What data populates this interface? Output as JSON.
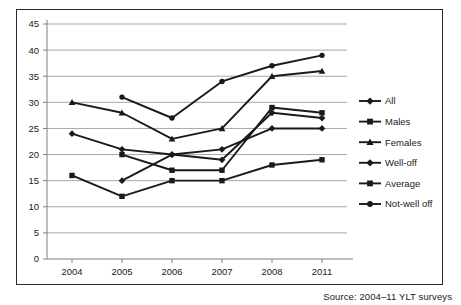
{
  "chart_data": {
    "type": "line",
    "title": "",
    "subtitle": "",
    "xlabel": "",
    "ylabel": "",
    "categories": [
      "2004",
      "2005",
      "2006",
      "2007",
      "2008",
      "2011"
    ],
    "ylim": [
      0,
      45
    ],
    "ytick_step": 5,
    "yticks": [
      "0",
      "5",
      "10",
      "15",
      "20",
      "25",
      "30",
      "35",
      "40",
      "45"
    ],
    "grid": "horizontal",
    "legend_position": "right",
    "series": [
      {
        "name": "All",
        "marker": "diamond",
        "values": [
          24,
          21,
          20,
          21,
          25,
          25
        ]
      },
      {
        "name": "Males",
        "marker": "square",
        "values": [
          16,
          12,
          15,
          15,
          18,
          19
        ]
      },
      {
        "name": "Females",
        "marker": "triangle",
        "values": [
          30,
          28,
          23,
          25,
          35,
          36
        ]
      },
      {
        "name": "Well-off",
        "marker": "diamond",
        "values": [
          null,
          15,
          20,
          19,
          28,
          27
        ]
      },
      {
        "name": "Average",
        "marker": "square",
        "values": [
          null,
          20,
          17,
          17,
          29,
          28
        ]
      },
      {
        "name": "Not-well off",
        "marker": "circle",
        "values": [
          null,
          31,
          27,
          34,
          37,
          39
        ]
      }
    ],
    "series_color": "#1a1a1a",
    "grid_color": "#a6a6a6",
    "axis_color": "#808080"
  },
  "legend": {
    "items": [
      {
        "label": "All"
      },
      {
        "label": "Males"
      },
      {
        "label": "Females"
      },
      {
        "label": "Well-off"
      },
      {
        "label": "Average"
      },
      {
        "label": "Not-well off"
      }
    ]
  },
  "footer": {
    "source": "Source: 2004–11 YLT surveys"
  }
}
